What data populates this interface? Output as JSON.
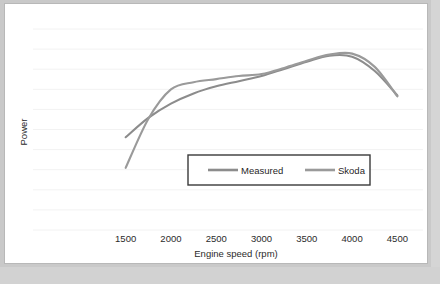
{
  "chart_data": {
    "type": "line",
    "title": "",
    "xlabel": "Engine speed (rpm)",
    "ylabel": "Power",
    "xlim": [
      1250,
      4650
    ],
    "ylim": [
      0,
      10
    ],
    "grid": true,
    "gridlines_count": 11,
    "legend_position": "inside-bottom-center",
    "xticks": [
      "1500",
      "2000",
      "2500",
      "3000",
      "3500",
      "4000",
      "4500"
    ],
    "xtick_values": [
      1500,
      2000,
      2500,
      3000,
      3500,
      4000,
      4500
    ],
    "yticks": [],
    "x": [
      1500,
      1750,
      2000,
      2250,
      2500,
      2750,
      3000,
      3250,
      3500,
      3750,
      4000,
      4250,
      4500
    ],
    "series": [
      {
        "name": "Measured",
        "color": "#8c8c8c",
        "values": [
          4.35,
          5.3,
          6.0,
          6.5,
          6.85,
          7.1,
          7.35,
          7.7,
          8.05,
          8.35,
          8.3,
          7.6,
          6.4
        ]
      },
      {
        "name": "Skoda",
        "color": "#9a9a9a",
        "values": [
          2.85,
          5.25,
          6.7,
          7.05,
          7.2,
          7.35,
          7.45,
          7.75,
          8.1,
          8.4,
          8.45,
          7.8,
          6.35
        ]
      }
    ],
    "annotations": [
      {
        "text": "curves cross near 1750 rpm"
      },
      {
        "text": "Skoda bows above Measured between 1900 and 3000 rpm"
      },
      {
        "text": "peak power near 3750-4000 rpm"
      }
    ]
  },
  "legend": {
    "entries": [
      {
        "label": "Measured"
      },
      {
        "label": "Skoda"
      }
    ]
  },
  "colors": {
    "measured": "#8c8c8c",
    "skoda": "#9a9a9a",
    "gridline": "#f2f2f2",
    "text": "#2b2b2b",
    "legend_border": "#3a3a3a",
    "frame": "#c9c9c9",
    "plot_background": "#ffffff"
  }
}
